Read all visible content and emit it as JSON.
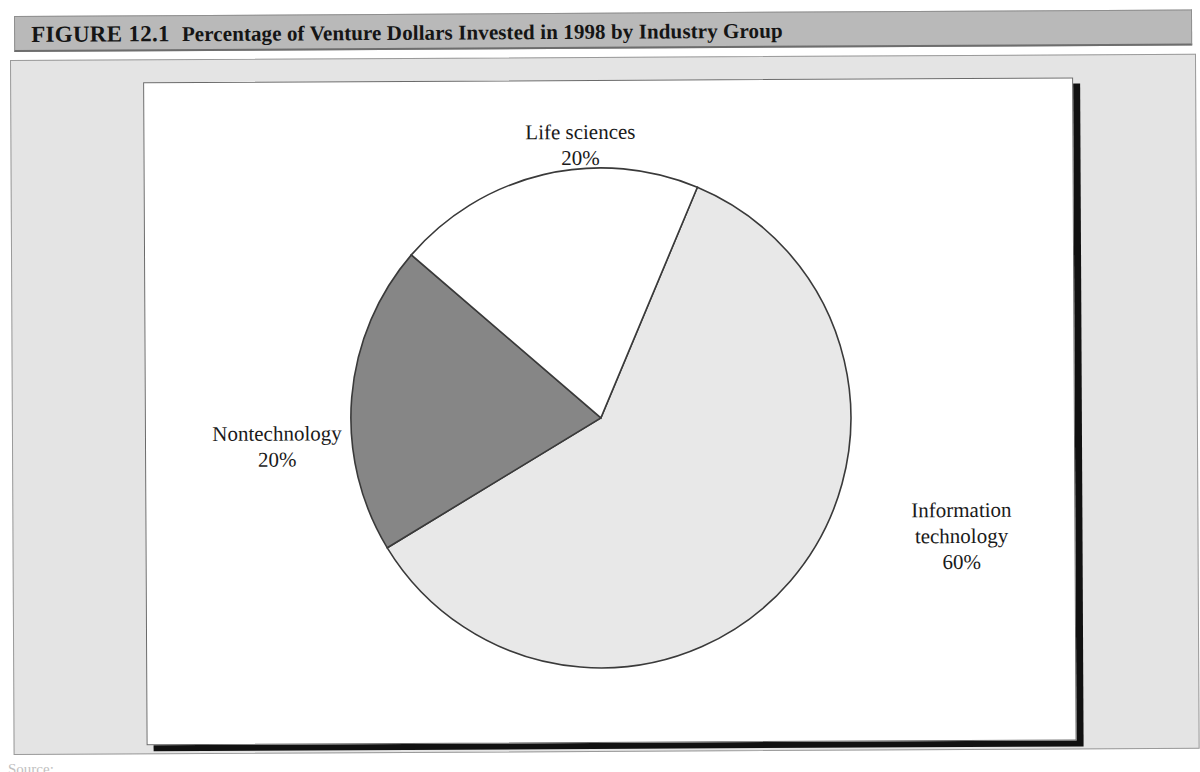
{
  "figure": {
    "label": "FIGURE 12.1",
    "title": "Percentage of Venture Dollars Invested in 1998 by Industry Group"
  },
  "source": {
    "text": "Source:",
    "visible": "partially clipped at page bottom"
  },
  "colors": {
    "header_bar": "#b9b9b9",
    "panel": "#e4e4e4",
    "chart_background": "#ffffff",
    "slice_life_sciences": "#ffffff",
    "slice_nontechnology": "#868686",
    "slice_information_technology": "#e8e8e8",
    "outline": "#3a3a3a",
    "shadow": "#111111"
  },
  "labels": {
    "life_sciences": {
      "name": "Life sciences",
      "value": "20%"
    },
    "nontechnology": {
      "name": "Nontechnology",
      "value": "20%"
    },
    "information_technology": {
      "name_line1": "Information",
      "name_line2": "technology",
      "value": "60%"
    }
  },
  "chart_data": {
    "type": "pie",
    "title": "Percentage of Venture Dollars Invested in 1998 by Industry Group",
    "categories": [
      "Information technology",
      "Nontechnology",
      "Life sciences"
    ],
    "values": [
      60,
      20,
      20
    ],
    "unit": "percent",
    "total": 100,
    "start_angle_deg": 23,
    "direction": "clockwise",
    "colors": [
      "#e8e8e8",
      "#868686",
      "#ffffff"
    ],
    "labels": [
      "Information technology 60%",
      "Nontechnology 20%",
      "Life sciences 20%"
    ],
    "legend": "none",
    "grid": false,
    "xlabel": "",
    "ylabel": ""
  }
}
